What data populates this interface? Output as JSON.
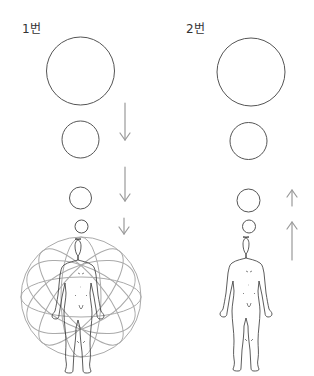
{
  "panels": [
    {
      "label": "1번",
      "circles": [
        {
          "cx": 80.5,
          "cy": 71,
          "r": 34
        },
        {
          "cx": 80.5,
          "cy": 139.5,
          "r": 18.5
        },
        {
          "cx": 80.5,
          "cy": 198,
          "r": 11
        },
        {
          "cx": 81.5,
          "cy": 226.5,
          "r": 6.5
        }
      ],
      "arrows": [
        {
          "direction": "down",
          "x": 125,
          "y1": 103,
          "y2": 140
        },
        {
          "direction": "down",
          "x": 125,
          "y1": 167,
          "y2": 201
        },
        {
          "direction": "down",
          "x": 124,
          "y1": 218,
          "y2": 234
        }
      ],
      "has_orbit_sphere": true
    },
    {
      "label": "2번",
      "circles": [
        {
          "cx": 251,
          "cy": 72,
          "r": 34
        },
        {
          "cx": 248.5,
          "cy": 141,
          "r": 18.5
        },
        {
          "cx": 248.5,
          "cy": 200.5,
          "r": 11.5
        },
        {
          "cx": 249,
          "cy": 226.5,
          "r": 6.5
        }
      ],
      "arrows": [
        {
          "direction": "up",
          "x": 292,
          "y1": 190,
          "y2": 206
        },
        {
          "direction": "up",
          "x": 292,
          "y1": 222,
          "y2": 260
        }
      ],
      "has_orbit_sphere": false
    }
  ],
  "colors": {
    "circle_stroke": "#555555",
    "arrow_stroke": "#999999",
    "orbit_stroke": "#aaaaaa",
    "figure_stroke": "#333333"
  }
}
